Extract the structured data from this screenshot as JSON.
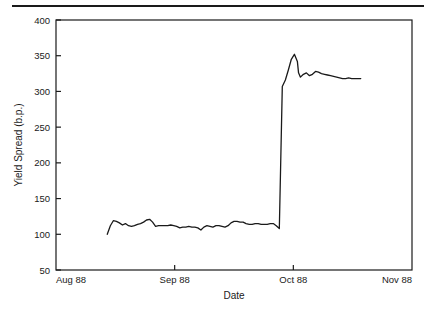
{
  "figure": {
    "has_top_rule": true,
    "background_color": "#ffffff",
    "line_color": "#1a1a1a",
    "axis_color": "#1a1a1a"
  },
  "chart_data": {
    "type": "line",
    "title": "",
    "xlabel": "Date",
    "ylabel": "Yield Spread (b.p.)",
    "xlim": [
      0,
      3
    ],
    "ylim": [
      50,
      400
    ],
    "ytick_values": [
      50,
      100,
      150,
      200,
      250,
      300,
      350,
      400
    ],
    "ytick_labels": [
      "50",
      "100",
      "150",
      "200",
      "250",
      "300",
      "350",
      "400"
    ],
    "xtick_values": [
      0,
      1,
      2,
      3
    ],
    "xtick_labels": [
      "Aug 88",
      "Sep 88",
      "Oct 88",
      "Nov 88"
    ],
    "grid": false,
    "legend": null,
    "series": [
      {
        "name": "Yield Spread",
        "x": [
          0.432,
          0.458,
          0.483,
          0.509,
          0.534,
          0.56,
          0.585,
          0.611,
          0.636,
          0.661,
          0.687,
          0.712,
          0.738,
          0.763,
          0.789,
          0.814,
          0.839,
          0.865,
          0.89,
          0.916,
          0.941,
          0.967,
          0.992,
          1.017,
          1.043,
          1.068,
          1.094,
          1.119,
          1.145,
          1.17,
          1.195,
          1.221,
          1.246,
          1.272,
          1.297,
          1.322,
          1.348,
          1.373,
          1.399,
          1.424,
          1.45,
          1.475,
          1.5,
          1.526,
          1.551,
          1.577,
          1.602,
          1.628,
          1.653,
          1.678,
          1.704,
          1.729,
          1.755,
          1.78,
          1.805,
          1.831,
          1.856,
          1.882,
          1.907,
          1.933,
          1.958,
          1.983,
          2.009,
          2.034,
          2.044,
          2.06,
          2.085,
          2.11,
          2.136,
          2.161,
          2.187,
          2.212,
          2.237,
          2.263,
          2.288,
          2.314,
          2.339,
          2.365,
          2.39,
          2.415,
          2.441,
          2.466,
          2.492,
          2.517,
          2.542,
          2.568
        ],
        "y": [
          100,
          112,
          119,
          118,
          116,
          113,
          115,
          112,
          111,
          112,
          114,
          115,
          117,
          120,
          121,
          117,
          111,
          112,
          112,
          112,
          112,
          113,
          112,
          111,
          109,
          110,
          110,
          111,
          110,
          110,
          109,
          106,
          110,
          112,
          111,
          110,
          112,
          112,
          111,
          110,
          112,
          116,
          118,
          118,
          117,
          117,
          115,
          114,
          114,
          115,
          115,
          114,
          114,
          114,
          115,
          115,
          112,
          108,
          307,
          316,
          330,
          345,
          352,
          342,
          326,
          320,
          324,
          326,
          322,
          324,
          328,
          327,
          325,
          324,
          323,
          322,
          321,
          320,
          319,
          318,
          318,
          319,
          318,
          318,
          318,
          318
        ]
      }
    ]
  }
}
